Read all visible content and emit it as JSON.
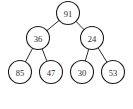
{
  "diagram": {
    "type": "binary-tree",
    "background_color": "#ffffff",
    "node_stroke_color": "#1c1c1c",
    "node_fill_color": "#ffffff",
    "edge_color": "#2b2b2b",
    "label_color": "#2a2a2a",
    "node_radius": 11.5,
    "levels": 3,
    "nodes": [
      {
        "id": "root",
        "label": "91",
        "cx": 68,
        "cy": 13,
        "level": 0
      },
      {
        "id": "n-36",
        "label": "36",
        "cx": 38,
        "cy": 38,
        "level": 1
      },
      {
        "id": "n-24",
        "label": "24",
        "cx": 92,
        "cy": 38,
        "level": 1
      },
      {
        "id": "n-85",
        "label": "85",
        "cx": 20,
        "cy": 72,
        "level": 2
      },
      {
        "id": "n-47",
        "label": "47",
        "cx": 51,
        "cy": 72,
        "level": 2
      },
      {
        "id": "n-30",
        "label": "30",
        "cx": 82,
        "cy": 72,
        "level": 2
      },
      {
        "id": "n-53",
        "label": "53",
        "cx": 113,
        "cy": 72,
        "level": 2
      }
    ],
    "edges": [
      {
        "id": "e-root-36",
        "from": "root",
        "to": "n-36"
      },
      {
        "id": "e-root-24",
        "from": "root",
        "to": "n-24"
      },
      {
        "id": "e-36-85",
        "from": "n-36",
        "to": "n-85"
      },
      {
        "id": "e-36-47",
        "from": "n-36",
        "to": "n-47"
      },
      {
        "id": "e-24-30",
        "from": "n-24",
        "to": "n-30"
      },
      {
        "id": "e-24-53",
        "from": "n-24",
        "to": "n-53"
      }
    ]
  }
}
